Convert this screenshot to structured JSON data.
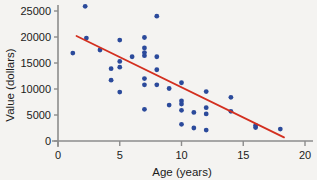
{
  "chart_data": {
    "type": "scatter",
    "title": "",
    "xlabel": "Age (years)",
    "ylabel": "Value (dollars)",
    "xlim": [
      0,
      20
    ],
    "ylim": [
      0,
      27000
    ],
    "xticks": [
      0,
      5,
      10,
      15,
      20
    ],
    "yticks": [
      0,
      5000,
      10000,
      15000,
      20000,
      25000
    ],
    "xtick_labels": [
      "0",
      "5",
      "10",
      "15",
      "20"
    ],
    "ytick_labels": [
      "0",
      "5000",
      "10000",
      "15000",
      "20000",
      "25000"
    ],
    "grid": false,
    "legend": null,
    "point_color": "#2b4a9b",
    "line_color": "#d32f1f",
    "axis_color": "#8c8c8c",
    "background_color": "#f4f3f1",
    "points": [
      {
        "x": 1.2,
        "y": 16900
      },
      {
        "x": 2.2,
        "y": 25900
      },
      {
        "x": 2.3,
        "y": 19800
      },
      {
        "x": 3.4,
        "y": 17500
      },
      {
        "x": 4.3,
        "y": 13900
      },
      {
        "x": 4.3,
        "y": 11700
      },
      {
        "x": 5.0,
        "y": 19400
      },
      {
        "x": 5.0,
        "y": 15300
      },
      {
        "x": 5.0,
        "y": 14200
      },
      {
        "x": 5.0,
        "y": 9400
      },
      {
        "x": 6.0,
        "y": 16200
      },
      {
        "x": 7.0,
        "y": 19900
      },
      {
        "x": 7.0,
        "y": 17900
      },
      {
        "x": 7.0,
        "y": 17000
      },
      {
        "x": 7.0,
        "y": 16400
      },
      {
        "x": 7.0,
        "y": 12000
      },
      {
        "x": 7.0,
        "y": 10800
      },
      {
        "x": 7.0,
        "y": 6100
      },
      {
        "x": 8.0,
        "y": 24000
      },
      {
        "x": 8.0,
        "y": 16200
      },
      {
        "x": 8.0,
        "y": 13700
      },
      {
        "x": 8.0,
        "y": 10800
      },
      {
        "x": 9.0,
        "y": 10100
      },
      {
        "x": 9.0,
        "y": 6900
      },
      {
        "x": 10.0,
        "y": 11200
      },
      {
        "x": 10.0,
        "y": 7700
      },
      {
        "x": 10.0,
        "y": 7100
      },
      {
        "x": 10.0,
        "y": 5900
      },
      {
        "x": 10.0,
        "y": 3200
      },
      {
        "x": 11.0,
        "y": 5500
      },
      {
        "x": 11.0,
        "y": 2500
      },
      {
        "x": 12.0,
        "y": 9500
      },
      {
        "x": 12.0,
        "y": 6400
      },
      {
        "x": 12.0,
        "y": 5200
      },
      {
        "x": 12.0,
        "y": 2100
      },
      {
        "x": 14.0,
        "y": 8400
      },
      {
        "x": 14.0,
        "y": 5700
      },
      {
        "x": 16.0,
        "y": 3000
      },
      {
        "x": 16.0,
        "y": 2600
      },
      {
        "x": 18.0,
        "y": 2300
      }
    ],
    "trendline": {
      "x0": 1.5,
      "y0": 20200,
      "x1": 18.3,
      "y1": 700,
      "slope": -1160,
      "intercept": 21940
    }
  }
}
